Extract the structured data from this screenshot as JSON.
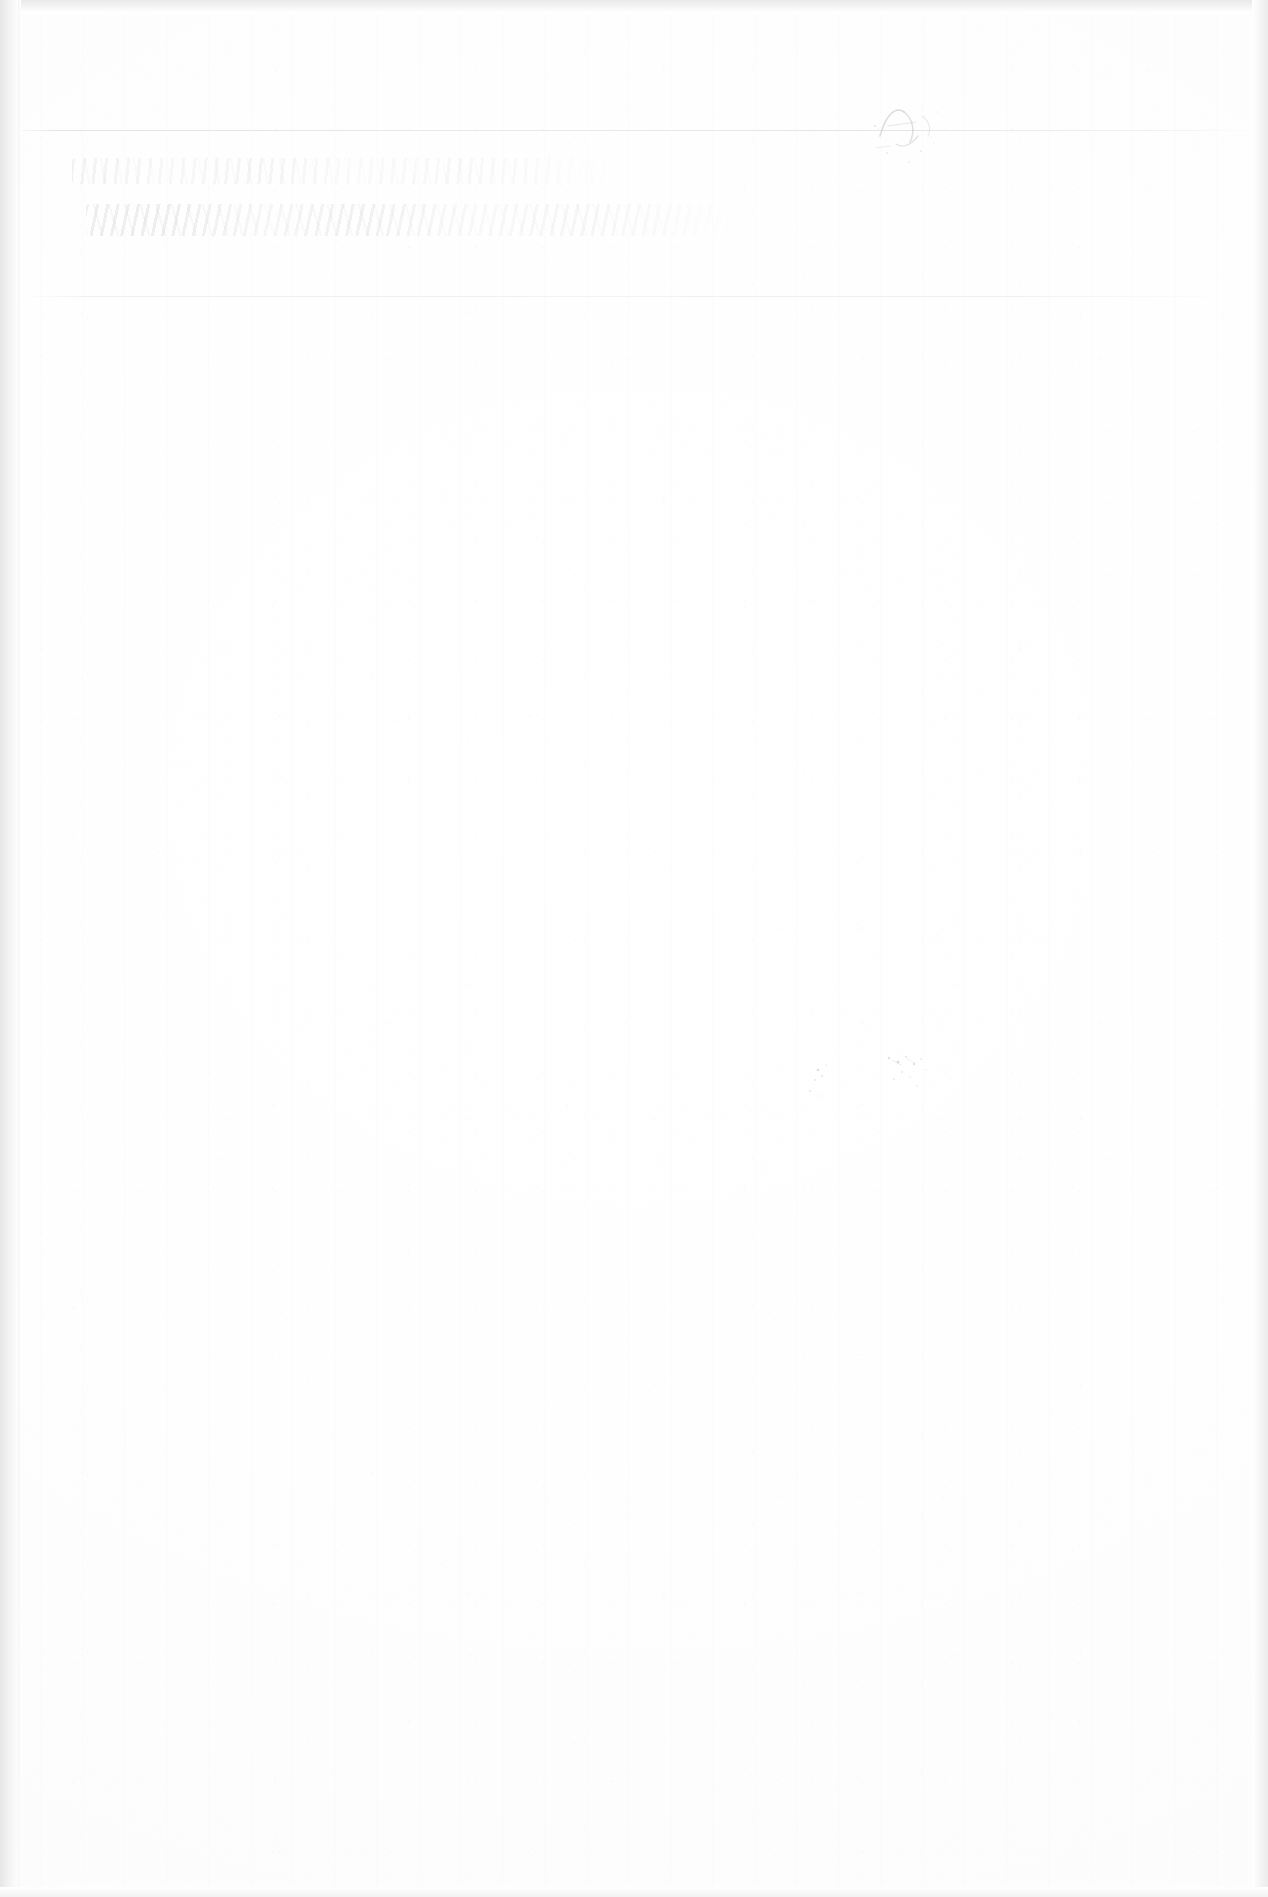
{
  "document": {
    "kind": "scanned-page",
    "page_description": "Blank scanned sheet of off-white paper with faint ruled lines and illegible ink residue",
    "visible_text": "",
    "page_width_px": 1268,
    "page_height_px": 1897
  },
  "colors": {
    "paper": "#ffffff",
    "paper_tint": "#fcfcfc",
    "edge_shadow": "#e6e6e7",
    "rule_line": "#96969b",
    "ink_faint": "#8e8e96"
  },
  "marks": {
    "rule_upper": {
      "name": "faint-horizontal-rule-upper",
      "label": "",
      "top_px": 130,
      "left_px": 10,
      "width_px": 1245
    },
    "rule_lower": {
      "name": "faint-horizontal-rule-lower",
      "label": "",
      "top_px": 296,
      "left_px": 24,
      "width_px": 1210
    },
    "handwriting_line_one": {
      "name": "illegible-handwriting-line-one",
      "label": "",
      "legible": false,
      "top_px": 158,
      "left_px": 72
    },
    "handwriting_line_two": {
      "name": "illegible-handwriting-line-two",
      "label": "",
      "legible": false,
      "top_px": 204,
      "left_px": 86
    },
    "corner_mark": {
      "name": "ink-mark-top-right",
      "label": "",
      "legible": false,
      "top_px": 96,
      "left_px": 866
    },
    "speck_cluster": {
      "name": "ink-specks-mid-right",
      "label": "",
      "legible": false,
      "top_px": 1046,
      "left_px": 788
    }
  }
}
